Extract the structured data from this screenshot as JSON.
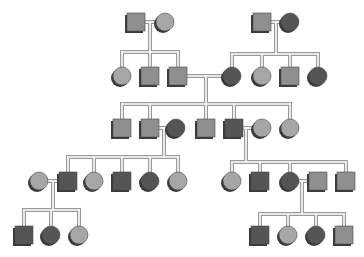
{
  "diagram": {
    "type": "pedigree",
    "colors": {
      "light": "#a6a6a6",
      "medium": "#8f8f8f",
      "dark": "#555555",
      "shadow": "#3a3a3a",
      "line_outer": "#9a9a9a",
      "line_inner": "#ffffff"
    },
    "size": 18,
    "individuals": [
      {
        "id": "g1a",
        "sex": "male",
        "shade": "medium",
        "x": 136,
        "y": 22
      },
      {
        "id": "g1b",
        "sex": "female",
        "shade": "light",
        "x": 165,
        "y": 22
      },
      {
        "id": "g1c",
        "sex": "male",
        "shade": "medium",
        "x": 262,
        "y": 22
      },
      {
        "id": "g1d",
        "sex": "female",
        "shade": "dark",
        "x": 290,
        "y": 22
      },
      {
        "id": "g2a",
        "sex": "female",
        "shade": "light",
        "x": 122,
        "y": 76
      },
      {
        "id": "g2b",
        "sex": "male",
        "shade": "medium",
        "x": 150,
        "y": 76
      },
      {
        "id": "g2c",
        "sex": "male",
        "shade": "medium",
        "x": 178,
        "y": 76
      },
      {
        "id": "g2d",
        "sex": "female",
        "shade": "dark",
        "x": 232,
        "y": 76
      },
      {
        "id": "g2e",
        "sex": "female",
        "shade": "light",
        "x": 262,
        "y": 76
      },
      {
        "id": "g2f",
        "sex": "male",
        "shade": "medium",
        "x": 290,
        "y": 76
      },
      {
        "id": "g2g",
        "sex": "female",
        "shade": "dark",
        "x": 318,
        "y": 76
      },
      {
        "id": "g3a",
        "sex": "male",
        "shade": "medium",
        "x": 122,
        "y": 128
      },
      {
        "id": "g3b",
        "sex": "male",
        "shade": "medium",
        "x": 150,
        "y": 128
      },
      {
        "id": "g3c",
        "sex": "female",
        "shade": "dark",
        "x": 176,
        "y": 128
      },
      {
        "id": "g3d",
        "sex": "male",
        "shade": "medium",
        "x": 206,
        "y": 128
      },
      {
        "id": "g3e",
        "sex": "male",
        "shade": "dark",
        "x": 234,
        "y": 128
      },
      {
        "id": "g3f",
        "sex": "female",
        "shade": "light",
        "x": 262,
        "y": 128
      },
      {
        "id": "g3g",
        "sex": "female",
        "shade": "light",
        "x": 290,
        "y": 128
      },
      {
        "id": "g4a",
        "sex": "female",
        "shade": "light",
        "x": 39,
        "y": 181
      },
      {
        "id": "g4b",
        "sex": "male",
        "shade": "dark",
        "x": 68,
        "y": 181
      },
      {
        "id": "g4c",
        "sex": "female",
        "shade": "light",
        "x": 94,
        "y": 181
      },
      {
        "id": "g4d",
        "sex": "male",
        "shade": "dark",
        "x": 122,
        "y": 181
      },
      {
        "id": "g4e",
        "sex": "female",
        "shade": "dark",
        "x": 150,
        "y": 181
      },
      {
        "id": "g4f",
        "sex": "female",
        "shade": "light",
        "x": 178,
        "y": 181
      },
      {
        "id": "g4g",
        "sex": "female",
        "shade": "light",
        "x": 232,
        "y": 181
      },
      {
        "id": "g4h",
        "sex": "male",
        "shade": "dark",
        "x": 260,
        "y": 181
      },
      {
        "id": "g4i",
        "sex": "female",
        "shade": "dark",
        "x": 290,
        "y": 181
      },
      {
        "id": "g4j",
        "sex": "male",
        "shade": "medium",
        "x": 318,
        "y": 181
      },
      {
        "id": "g4k",
        "sex": "male",
        "shade": "medium",
        "x": 346,
        "y": 181
      },
      {
        "id": "g5a",
        "sex": "male",
        "shade": "dark",
        "x": 24,
        "y": 235
      },
      {
        "id": "g5b",
        "sex": "female",
        "shade": "dark",
        "x": 51,
        "y": 235
      },
      {
        "id": "g5c",
        "sex": "female",
        "shade": "light",
        "x": 79,
        "y": 235
      },
      {
        "id": "g5d",
        "sex": "male",
        "shade": "dark",
        "x": 260,
        "y": 235
      },
      {
        "id": "g5e",
        "sex": "female",
        "shade": "light",
        "x": 288,
        "y": 235
      },
      {
        "id": "g5f",
        "sex": "female",
        "shade": "dark",
        "x": 316,
        "y": 235
      },
      {
        "id": "g5g",
        "sex": "male",
        "shade": "medium",
        "x": 344,
        "y": 235
      }
    ],
    "families": [
      {
        "partners": [
          "g1a",
          "g1b"
        ],
        "mx": 150,
        "my": 22,
        "sib_y": 52,
        "children": [
          "g2a",
          "g2b",
          "g2c"
        ]
      },
      {
        "partners": [
          "g1c",
          "g1d"
        ],
        "mx": 276,
        "my": 22,
        "sib_y": 54,
        "children": [
          "g2d",
          "g2e",
          "g2f",
          "g2g"
        ]
      },
      {
        "partners": [
          "g2c",
          "g2d"
        ],
        "mx": 206,
        "my": 76,
        "sib_y": 104,
        "children": [
          "g3a",
          "g3b",
          "g3d",
          "g3e",
          "g3g"
        ]
      },
      {
        "partners": [
          "g3b",
          "g3c"
        ],
        "mx": 164,
        "my": 128,
        "sib_y": 157,
        "children": [
          "g4b",
          "g4c",
          "g4d",
          "g4e",
          "g4f"
        ]
      },
      {
        "partners": [
          "g3e",
          "g3f"
        ],
        "mx": 246,
        "my": 128,
        "sib_y": 162,
        "children": [
          "g4g",
          "g4h",
          "g4i",
          "g4k"
        ]
      },
      {
        "partners": [
          "g4a",
          "g4b"
        ],
        "mx": 53,
        "my": 181,
        "sib_y": 210,
        "children": [
          "g5a",
          "g5b",
          "g5c"
        ]
      },
      {
        "partners": [
          "g4i",
          "g4j"
        ],
        "mx": 302,
        "my": 181,
        "sib_y": 214,
        "children": [
          "g5d",
          "g5e",
          "g5f",
          "g5g"
        ]
      }
    ]
  }
}
